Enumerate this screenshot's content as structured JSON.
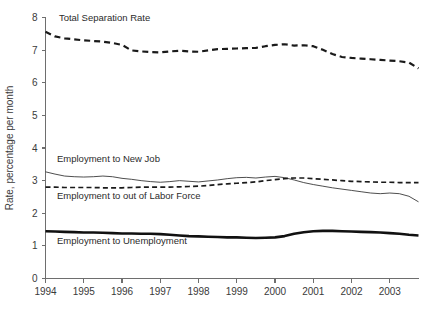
{
  "chart_data": {
    "type": "line",
    "title": "",
    "xlabel": "",
    "ylabel": "Rate, percentage per month",
    "xlim": [
      1994.0,
      2003.75
    ],
    "ylim": [
      0,
      8
    ],
    "yticks": [
      0,
      1,
      2,
      3,
      4,
      5,
      6,
      7,
      8
    ],
    "ytick_labels": [
      "0",
      "1",
      "2",
      "3",
      "4",
      "5",
      "6",
      "7",
      "8"
    ],
    "xticks": [
      1994,
      1995,
      1996,
      1997,
      1998,
      1999,
      2000,
      2001,
      2002,
      2003
    ],
    "xtick_labels": [
      "1994",
      "1995",
      "1996",
      "1997",
      "1998",
      "1999",
      "2000",
      "2001",
      "2002",
      "2003"
    ],
    "grid": false,
    "legend_position": "inline-annotations",
    "x": [
      1994.0,
      1994.25,
      1994.5,
      1994.75,
      1995.0,
      1995.25,
      1995.5,
      1995.75,
      1996.0,
      1996.25,
      1996.5,
      1996.75,
      1997.0,
      1997.25,
      1997.5,
      1997.75,
      1998.0,
      1998.25,
      1998.5,
      1998.75,
      1999.0,
      1999.25,
      1999.5,
      1999.75,
      2000.0,
      2000.25,
      2000.5,
      2000.75,
      2001.0,
      2001.25,
      2001.5,
      2001.75,
      2002.0,
      2002.25,
      2002.5,
      2002.75,
      2003.0,
      2003.25,
      2003.5,
      2003.75
    ],
    "series": [
      {
        "name": "Total Separation Rate",
        "style": "dashed",
        "width": 2.2,
        "color": "#1a1a1a",
        "label_x": 1994.35,
        "label_y": 7.88,
        "values": [
          7.56,
          7.42,
          7.36,
          7.33,
          7.3,
          7.28,
          7.26,
          7.22,
          7.16,
          6.99,
          6.96,
          6.94,
          6.93,
          6.96,
          6.98,
          6.96,
          6.95,
          6.99,
          7.03,
          7.04,
          7.05,
          7.06,
          7.07,
          7.12,
          7.16,
          7.18,
          7.14,
          7.15,
          7.12,
          7.01,
          6.88,
          6.79,
          6.76,
          6.74,
          6.72,
          6.7,
          6.68,
          6.66,
          6.62,
          6.44
        ]
      },
      {
        "name": "Employment to New Job",
        "style": "solid",
        "width": 0.9,
        "color": "#3a3a3a",
        "label_x": 1994.3,
        "label_y": 3.58,
        "values": [
          3.27,
          3.2,
          3.14,
          3.12,
          3.11,
          3.12,
          3.14,
          3.12,
          3.07,
          3.04,
          3.0,
          2.97,
          2.95,
          2.97,
          3.0,
          2.98,
          2.96,
          2.99,
          3.02,
          3.06,
          3.09,
          3.1,
          3.08,
          3.11,
          3.13,
          3.09,
          3.02,
          2.94,
          2.88,
          2.83,
          2.78,
          2.74,
          2.7,
          2.66,
          2.62,
          2.6,
          2.62,
          2.6,
          2.52,
          2.35
        ]
      },
      {
        "name": "Employment to out of Labor Force",
        "style": "dashed",
        "width": 1.7,
        "color": "#1a1a1a",
        "label_x": 1994.3,
        "label_y": 2.44,
        "values": [
          2.8,
          2.8,
          2.79,
          2.79,
          2.79,
          2.79,
          2.78,
          2.78,
          2.78,
          2.79,
          2.8,
          2.8,
          2.8,
          2.8,
          2.81,
          2.82,
          2.83,
          2.85,
          2.88,
          2.9,
          2.92,
          2.94,
          2.96,
          3.0,
          3.03,
          3.06,
          3.08,
          3.08,
          3.06,
          3.04,
          3.02,
          3.0,
          2.98,
          2.97,
          2.96,
          2.95,
          2.95,
          2.94,
          2.94,
          2.94
        ]
      },
      {
        "name": "Employment to Unemployment",
        "style": "solid",
        "width": 2.6,
        "color": "#111111",
        "label_x": 1994.3,
        "label_y": 1.06,
        "values": [
          1.45,
          1.44,
          1.43,
          1.42,
          1.41,
          1.41,
          1.4,
          1.39,
          1.38,
          1.38,
          1.37,
          1.37,
          1.36,
          1.34,
          1.32,
          1.3,
          1.29,
          1.28,
          1.27,
          1.26,
          1.26,
          1.25,
          1.24,
          1.25,
          1.26,
          1.3,
          1.37,
          1.42,
          1.45,
          1.46,
          1.46,
          1.45,
          1.44,
          1.43,
          1.42,
          1.41,
          1.39,
          1.37,
          1.34,
          1.32
        ]
      }
    ]
  },
  "axes": {
    "y_title": "Rate, percentage per month"
  },
  "colors": {
    "axis": "#6e6e6e",
    "text": "#3a3a3a",
    "line_dark": "#1a1a1a",
    "line_thin": "#3a3a3a",
    "background": "#ffffff"
  }
}
